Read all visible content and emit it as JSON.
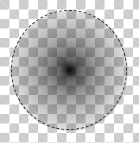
{
  "canvas": {
    "width": 139,
    "height": 143,
    "background": "transparency-checkerboard",
    "checker_colors": [
      "#ffffff",
      "#cccccc"
    ]
  },
  "shape": {
    "type": "radial-gradient-ellipse",
    "center_color": "#000000",
    "edge_color": "transparent",
    "selection": "elliptical-marching-ants"
  }
}
